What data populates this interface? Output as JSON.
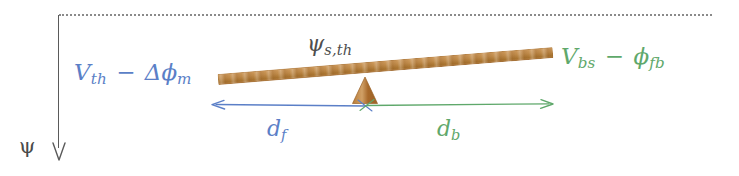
{
  "diagram": {
    "type": "lever-balance-diagram",
    "title_text": "",
    "reference_line": {
      "name": "dotted-reference-line",
      "style": "dotted",
      "color": "#8a8a8a"
    },
    "axis": {
      "label": "ψ",
      "direction": "down",
      "arrow_glyph": "↓",
      "color": "#5a5a5a"
    },
    "labels": {
      "left": {
        "var1": "V",
        "var1_sub": "th",
        "operator": "−",
        "var2": "Δϕ",
        "var2_sub": "m",
        "color": "#5b7fc7"
      },
      "right": {
        "var1": "V",
        "var1_sub": "bs",
        "operator": "−",
        "var2": "ϕ",
        "var2_sub": "fb",
        "color": "#5fa86b"
      },
      "center": {
        "var1": "ψ",
        "var1_sub": "s,th",
        "color": "#4e4e4e"
      },
      "distance_front": {
        "var1": "d",
        "var1_sub": "f",
        "color": "#5b7fc7"
      },
      "distance_back": {
        "var1": "d",
        "var1_sub": "b",
        "color": "#5fa86b"
      }
    },
    "beam": {
      "name": "wooden-plank",
      "color": "#c08b4a",
      "tilt_degrees": -4.6
    },
    "fulcrum": {
      "name": "fulcrum-triangle",
      "color": "#b2732d"
    },
    "arrows": {
      "left_arrow_color": "#5b7fc7",
      "right_arrow_color": "#5fa86b"
    }
  }
}
